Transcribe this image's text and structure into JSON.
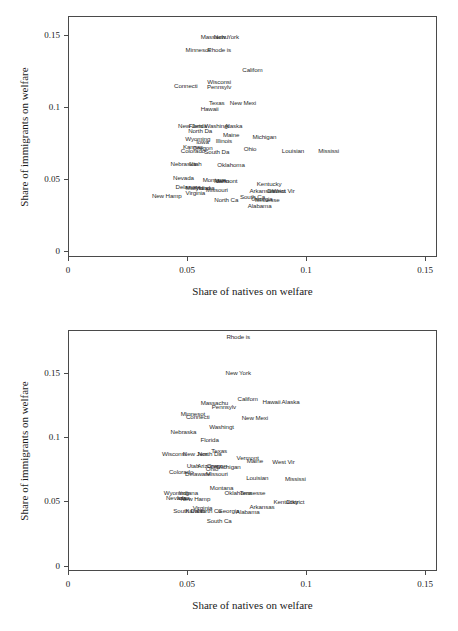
{
  "figure": {
    "panel_count": 2,
    "background": "#ffffff",
    "text_color": "#1a1a1a",
    "frame_color": "#4a4a4a"
  },
  "chart_data": [
    {
      "type": "scatter",
      "panel": "top",
      "title": "",
      "xlabel": "Share of natives on welfare",
      "ylabel": "Share of immigrants on welfare",
      "xlim": [
        0,
        0.155
      ],
      "ylim": [
        -0.004,
        0.163
      ],
      "xticks": [
        0,
        0.05,
        0.1,
        0.15
      ],
      "xticklabels": [
        "0",
        "0.05",
        "0.1",
        "0.15"
      ],
      "yticks": [
        0,
        0.05,
        0.1,
        0.15
      ],
      "yticklabels": [
        "0",
        "0.05",
        "0.1",
        "0.15"
      ],
      "grid": false,
      "legend": "none",
      "marker": "text-label",
      "points": [
        {
          "label": "Massachu",
          "x": 0.0615,
          "y": 0.1485
        },
        {
          "label": "New York",
          "x": 0.0665,
          "y": 0.1485
        },
        {
          "label": "Minnesot",
          "x": 0.0545,
          "y": 0.1395
        },
        {
          "label": "Rhode is",
          "x": 0.0635,
          "y": 0.1395
        },
        {
          "label": "Califom",
          "x": 0.0775,
          "y": 0.1255
        },
        {
          "label": "Wisconsi",
          "x": 0.0635,
          "y": 0.1175
        },
        {
          "label": "Connecti",
          "x": 0.0495,
          "y": 0.1145
        },
        {
          "label": "Pennsylv",
          "x": 0.0635,
          "y": 0.1135
        },
        {
          "label": "Texas",
          "x": 0.0625,
          "y": 0.1025
        },
        {
          "label": "New Mexi",
          "x": 0.0735,
          "y": 0.1025
        },
        {
          "label": "Hawaii",
          "x": 0.0595,
          "y": 0.0985
        },
        {
          "label": "New Jers",
          "x": 0.0515,
          "y": 0.0865
        },
        {
          "label": "Florida",
          "x": 0.0545,
          "y": 0.0865
        },
        {
          "label": "Washingt",
          "x": 0.0625,
          "y": 0.0865
        },
        {
          "label": "Alaska",
          "x": 0.0695,
          "y": 0.0865
        },
        {
          "label": "North Da",
          "x": 0.0555,
          "y": 0.0835
        },
        {
          "label": "Maine",
          "x": 0.0685,
          "y": 0.0805
        },
        {
          "label": "Michigan",
          "x": 0.0825,
          "y": 0.0795
        },
        {
          "label": "Wyoming",
          "x": 0.0545,
          "y": 0.0775
        },
        {
          "label": "Illinois",
          "x": 0.0655,
          "y": 0.0765
        },
        {
          "label": "Iowa",
          "x": 0.0565,
          "y": 0.0755
        },
        {
          "label": "Kansas",
          "x": 0.0525,
          "y": 0.0725
        },
        {
          "label": "Oregon",
          "x": 0.0565,
          "y": 0.0715
        },
        {
          "label": "Ohio",
          "x": 0.0765,
          "y": 0.0705
        },
        {
          "label": "Louisian",
          "x": 0.0945,
          "y": 0.0695
        },
        {
          "label": "Mississi",
          "x": 0.1095,
          "y": 0.0695
        },
        {
          "label": "Colorado",
          "x": 0.0525,
          "y": 0.0695
        },
        {
          "label": "South Da",
          "x": 0.0625,
          "y": 0.0685
        },
        {
          "label": "Nebraska",
          "x": 0.0485,
          "y": 0.0605
        },
        {
          "label": "Utah",
          "x": 0.0535,
          "y": 0.0605
        },
        {
          "label": "Oklahoma",
          "x": 0.0685,
          "y": 0.0595
        },
        {
          "label": "Nevada",
          "x": 0.0485,
          "y": 0.0505
        },
        {
          "label": "Montana",
          "x": 0.0615,
          "y": 0.0495
        },
        {
          "label": "Idaho",
          "x": 0.0645,
          "y": 0.0485
        },
        {
          "label": "Vermont",
          "x": 0.0665,
          "y": 0.0485
        },
        {
          "label": "Kentucky",
          "x": 0.0845,
          "y": 0.0465
        },
        {
          "label": "Delaware",
          "x": 0.0505,
          "y": 0.0445
        },
        {
          "label": "Maryland",
          "x": 0.0545,
          "y": 0.0435
        },
        {
          "label": "Indiana",
          "x": 0.0575,
          "y": 0.0435
        },
        {
          "label": "Missouri",
          "x": 0.0625,
          "y": 0.0425
        },
        {
          "label": "Arkansas",
          "x": 0.0815,
          "y": 0.0415
        },
        {
          "label": "District",
          "x": 0.0875,
          "y": 0.0415
        },
        {
          "label": "West Vir",
          "x": 0.0905,
          "y": 0.0415
        },
        {
          "label": "Virginia",
          "x": 0.0535,
          "y": 0.0405
        },
        {
          "label": "New Hamp",
          "x": 0.0415,
          "y": 0.0385
        },
        {
          "label": "South Ca",
          "x": 0.0775,
          "y": 0.0375
        },
        {
          "label": "Georgia",
          "x": 0.0815,
          "y": 0.0365
        },
        {
          "label": "Tennesse",
          "x": 0.0835,
          "y": 0.0355
        },
        {
          "label": "North Ca",
          "x": 0.0665,
          "y": 0.0355
        },
        {
          "label": "Alabama",
          "x": 0.0805,
          "y": 0.0315
        }
      ]
    },
    {
      "type": "scatter",
      "panel": "bottom",
      "title": "",
      "xlabel": "Share of natives on welfare",
      "ylabel": "Share of immigrants on welfare",
      "xlim": [
        0,
        0.155
      ],
      "ylim": [
        -0.004,
        0.183
      ],
      "xticks": [
        0,
        0.05,
        0.1,
        0.15
      ],
      "xticklabels": [
        "0",
        "0.05",
        "0.1",
        "0.15"
      ],
      "yticks": [
        0,
        0.05,
        0.1,
        0.15
      ],
      "yticklabels": [
        "0",
        "0.05",
        "0.1",
        "0.15"
      ],
      "grid": false,
      "legend": "none",
      "marker": "text-label",
      "points": [
        {
          "label": "Rhode is",
          "x": 0.0715,
          "y": 0.1775
        },
        {
          "label": "New York",
          "x": 0.0715,
          "y": 0.1495
        },
        {
          "label": "Califom",
          "x": 0.0755,
          "y": 0.1295
        },
        {
          "label": "Hawaii",
          "x": 0.0855,
          "y": 0.1275
        },
        {
          "label": "Alaska",
          "x": 0.0935,
          "y": 0.1275
        },
        {
          "label": "Massachu",
          "x": 0.0615,
          "y": 0.1265
        },
        {
          "label": "Pennsylv",
          "x": 0.0655,
          "y": 0.1235
        },
        {
          "label": "Minnesot",
          "x": 0.0525,
          "y": 0.1175
        },
        {
          "label": "Connecti",
          "x": 0.0545,
          "y": 0.1155
        },
        {
          "label": "New Mexi",
          "x": 0.0785,
          "y": 0.1145
        },
        {
          "label": "Washingt",
          "x": 0.0645,
          "y": 0.1075
        },
        {
          "label": "Nebraska",
          "x": 0.0485,
          "y": 0.1035
        },
        {
          "label": "Florida",
          "x": 0.0595,
          "y": 0.0975
        },
        {
          "label": "Texas",
          "x": 0.0635,
          "y": 0.0895
        },
        {
          "label": "Wisconsi",
          "x": 0.0445,
          "y": 0.0865
        },
        {
          "label": "New Jers",
          "x": 0.0535,
          "y": 0.0865
        },
        {
          "label": "North Da",
          "x": 0.0595,
          "y": 0.0865
        },
        {
          "label": "Vermont",
          "x": 0.0755,
          "y": 0.0835
        },
        {
          "label": "Maine",
          "x": 0.0785,
          "y": 0.0815
        },
        {
          "label": "West Vir",
          "x": 0.0905,
          "y": 0.0805
        },
        {
          "label": "Utah",
          "x": 0.0525,
          "y": 0.0775
        },
        {
          "label": "Arizona",
          "x": 0.0585,
          "y": 0.0775
        },
        {
          "label": "Oregon",
          "x": 0.0625,
          "y": 0.0775
        },
        {
          "label": "Michigan",
          "x": 0.0675,
          "y": 0.0765
        },
        {
          "label": "Ohio",
          "x": 0.0605,
          "y": 0.0755
        },
        {
          "label": "Colorado",
          "x": 0.0475,
          "y": 0.0725
        },
        {
          "label": "Delaware",
          "x": 0.0545,
          "y": 0.0715
        },
        {
          "label": "Missouri",
          "x": 0.0625,
          "y": 0.0715
        },
        {
          "label": "Louisian",
          "x": 0.0795,
          "y": 0.0685
        },
        {
          "label": "Mississi",
          "x": 0.0955,
          "y": 0.0675
        },
        {
          "label": "Montana",
          "x": 0.0645,
          "y": 0.0605
        },
        {
          "label": "Oklahoma",
          "x": 0.0715,
          "y": 0.0565
        },
        {
          "label": "Tennesse",
          "x": 0.0775,
          "y": 0.0565
        },
        {
          "label": "Wyoming",
          "x": 0.0455,
          "y": 0.0565
        },
        {
          "label": "Indiana",
          "x": 0.0505,
          "y": 0.0565
        },
        {
          "label": "Nevada",
          "x": 0.0455,
          "y": 0.0525
        },
        {
          "label": "Iowa",
          "x": 0.0485,
          "y": 0.0525
        },
        {
          "label": "New Hamp",
          "x": 0.0535,
          "y": 0.0515
        },
        {
          "label": "Kentucky",
          "x": 0.0915,
          "y": 0.0495
        },
        {
          "label": "District",
          "x": 0.0955,
          "y": 0.0495
        },
        {
          "label": "Arkansas",
          "x": 0.0815,
          "y": 0.0455
        },
        {
          "label": "Virginia",
          "x": 0.0565,
          "y": 0.0445
        },
        {
          "label": "South Da",
          "x": 0.0495,
          "y": 0.0425
        },
        {
          "label": "Kansas",
          "x": 0.0535,
          "y": 0.0425
        },
        {
          "label": "North Ca",
          "x": 0.0595,
          "y": 0.0425
        },
        {
          "label": "Georgia",
          "x": 0.0675,
          "y": 0.0425
        },
        {
          "label": "Alabama",
          "x": 0.0755,
          "y": 0.0415
        },
        {
          "label": "South Ca",
          "x": 0.0635,
          "y": 0.0345
        }
      ]
    }
  ]
}
